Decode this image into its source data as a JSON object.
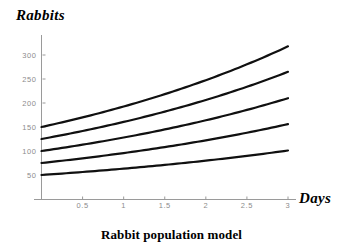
{
  "chart_data": {
    "type": "line",
    "title": "Rabbit population model",
    "xlabel": "Days",
    "ylabel": "Rabbits",
    "xlim": [
      0,
      3.05
    ],
    "ylim": [
      0,
      340
    ],
    "grid": false,
    "legend": "none",
    "xticks": [
      "0.5",
      "1",
      "1.5",
      "2",
      "2.5",
      "3"
    ],
    "xtick_values": [
      0.5,
      1,
      1.5,
      2,
      2.5,
      3
    ],
    "yticks": [
      "50",
      "100",
      "150",
      "200",
      "250",
      "300"
    ],
    "ytick_values": [
      50,
      100,
      150,
      200,
      250,
      300
    ],
    "x": [
      0,
      0.25,
      0.5,
      0.75,
      1,
      1.25,
      1.5,
      1.75,
      2,
      2.25,
      2.5,
      2.75,
      3
    ],
    "series": [
      {
        "name": "P0 = 150",
        "initial_value": 150,
        "final_value": 318,
        "values": [
          150,
          158,
          167,
          177,
          187,
          198,
          210,
          222,
          235,
          248,
          263,
          278,
          318
        ]
      },
      {
        "name": "P0 = 125",
        "initial_value": 125,
        "final_value": 265,
        "values": [
          125,
          132,
          140,
          148,
          156,
          165,
          175,
          185,
          196,
          207,
          219,
          232,
          265
        ]
      },
      {
        "name": "P0 = 100",
        "initial_value": 100,
        "final_value": 210,
        "values": [
          100,
          106,
          112,
          118,
          125,
          132,
          140,
          148,
          157,
          166,
          175,
          185,
          210
        ]
      },
      {
        "name": "P0 = 75",
        "initial_value": 75,
        "final_value": 156,
        "values": [
          75,
          79,
          84,
          89,
          94,
          99,
          105,
          111,
          117,
          124,
          131,
          139,
          156
        ]
      },
      {
        "name": "P0 = 50",
        "initial_value": 50,
        "final_value": 101,
        "values": [
          50,
          53,
          56,
          59,
          62,
          66,
          70,
          74,
          78,
          83,
          88,
          93,
          101
        ]
      }
    ],
    "colors": {
      "curve": "#101010",
      "axis": "#9a9a9a",
      "tick_label": "#8c8c8c",
      "text": "#000000",
      "background": "#ffffff"
    }
  }
}
